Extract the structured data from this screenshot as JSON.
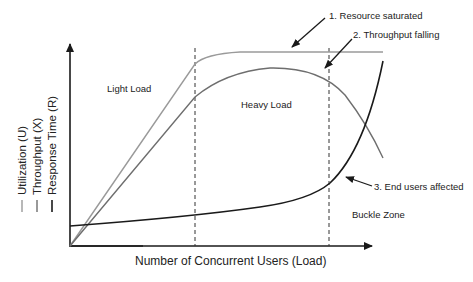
{
  "diagram": {
    "x_axis_label": "Number of Concurrent Users (Load)",
    "legend": [
      {
        "label": "Utilization (U)",
        "color": "#9a9a9a"
      },
      {
        "label": "Throughput (X)",
        "color": "#6e6e6e"
      },
      {
        "label": "Response Time (R)",
        "color": "#1a1a1a"
      }
    ],
    "regions": {
      "light": "Light Load",
      "heavy": "Heavy Load",
      "buckle": "Buckle Zone"
    },
    "annotations": [
      {
        "label": "1. Resource saturated"
      },
      {
        "label": "2. Throughput falling"
      },
      {
        "label": "3. End users affected"
      }
    ]
  }
}
